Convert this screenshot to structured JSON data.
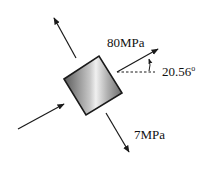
{
  "diagram": {
    "type": "stress-element",
    "element": {
      "shape": "rotated-square",
      "fill": "gray-gradient",
      "rotation_deg": -33
    },
    "labels": {
      "principal_stress_1": "80MPa",
      "principal_stress_2": "7MPa",
      "angle": "20.56",
      "angle_unit": "o"
    },
    "arrows": [
      {
        "name": "tension-arrow-upper-left",
        "direction": "outward"
      },
      {
        "name": "tension-arrow-upper-right",
        "direction": "outward"
      },
      {
        "name": "compression-arrow-lower-left",
        "direction": "inward"
      },
      {
        "name": "tension-arrow-lower-right",
        "direction": "outward"
      }
    ],
    "colors": {
      "stroke": "#1a1a1a",
      "dark": "#555555",
      "light": "#f2f2f2"
    }
  }
}
